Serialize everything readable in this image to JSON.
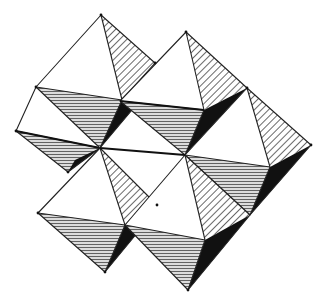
{
  "diagram": {
    "title": "Corner-sharing octahedra framework (polyhedral crystal structure)",
    "shading": {
      "light_face": "white",
      "diagonal_hatch_face": "diagonal-hatched",
      "horizontal_hatch_face": "horizontal-hatched (grey)",
      "dark_face": "solid black"
    },
    "colors": {
      "background": "#ffffff",
      "edge": "#222222",
      "hatch": "#555555",
      "dark_face": "#111111",
      "grey_face": "#d8d8d8"
    },
    "octahedra": [
      {
        "id": "octahedron-top-left"
      },
      {
        "id": "octahedron-top-right"
      },
      {
        "id": "octahedron-right"
      },
      {
        "id": "octahedron-left-middle"
      },
      {
        "id": "octahedron-bottom-left"
      },
      {
        "id": "octahedron-bottom-right"
      }
    ]
  }
}
